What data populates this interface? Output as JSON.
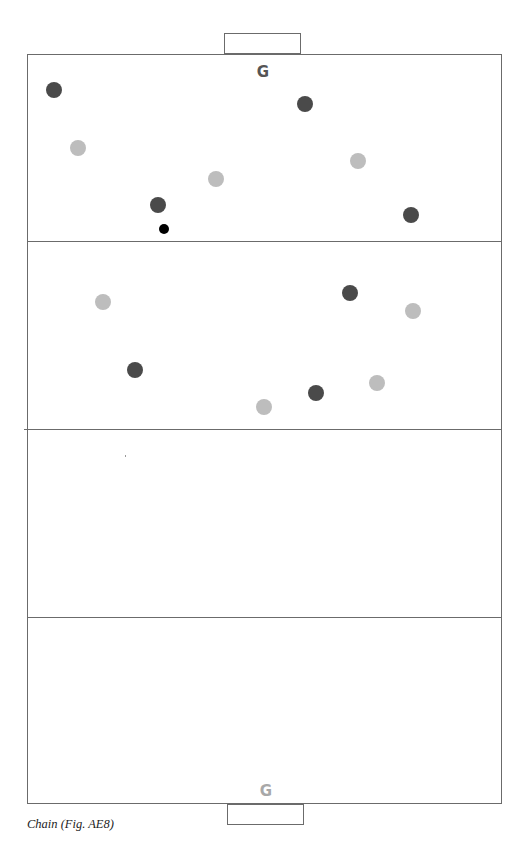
{
  "diagram": {
    "caption": "Chain (Fig. AE8)",
    "colors": {
      "court_line": "#6b6b6b",
      "team_dark": "#4a4a4a",
      "team_light": "#bdbdbd",
      "ball": "#000000",
      "goal_top_label": "#555555",
      "goal_bottom_label": "#a8a8a8"
    },
    "court": {
      "left": 27,
      "top": 54,
      "width": 475,
      "height": 750,
      "third_lines_y": [
        241,
        430,
        617
      ]
    },
    "goals": [
      {
        "id": "top",
        "label": "G",
        "box": {
          "x": 224,
          "y": 33,
          "w": 77,
          "h": 21
        },
        "label_pos": {
          "x": 253,
          "y": 63
        }
      },
      {
        "id": "bottom",
        "label": "G",
        "box": {
          "x": 227,
          "y": 804,
          "w": 77,
          "h": 21
        },
        "label_pos": {
          "x": 256,
          "y": 782
        }
      }
    ],
    "players": [
      {
        "team": "dark",
        "x": 54,
        "y": 90
      },
      {
        "team": "dark",
        "x": 305,
        "y": 104
      },
      {
        "team": "dark",
        "x": 158,
        "y": 205
      },
      {
        "team": "dark",
        "x": 411,
        "y": 215
      },
      {
        "team": "dark",
        "x": 350,
        "y": 293
      },
      {
        "team": "dark",
        "x": 135,
        "y": 370
      },
      {
        "team": "dark",
        "x": 316,
        "y": 393
      },
      {
        "team": "light",
        "x": 78,
        "y": 148
      },
      {
        "team": "light",
        "x": 358,
        "y": 161
      },
      {
        "team": "light",
        "x": 216,
        "y": 179
      },
      {
        "team": "light",
        "x": 103,
        "y": 302
      },
      {
        "team": "light",
        "x": 413,
        "y": 311
      },
      {
        "team": "light",
        "x": 377,
        "y": 383
      },
      {
        "team": "light",
        "x": 264,
        "y": 407
      }
    ],
    "ball": {
      "x": 164,
      "y": 229
    }
  }
}
